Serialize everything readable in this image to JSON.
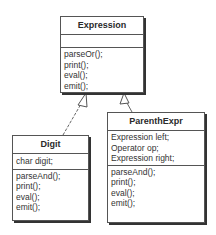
{
  "classes": {
    "expression": {
      "name": "Expression",
      "attributes": [],
      "methods": [
        "parseOr();",
        "print();",
        "eval();",
        "emit();"
      ]
    },
    "digit": {
      "name": "Digit",
      "attributes": [
        "char digit;"
      ],
      "methods": [
        "parseAnd();",
        "print();",
        "eval();",
        "emit();"
      ]
    },
    "parenthexpr": {
      "name": "ParenthExpr",
      "attributes": [
        "Expression left;",
        "Operator op;",
        "Expression right;"
      ],
      "methods": [
        "parseAnd();",
        "print();",
        "eval();",
        "emit();"
      ]
    }
  },
  "relations": [
    {
      "type": "generalization",
      "from": "Digit",
      "to": "Expression"
    },
    {
      "type": "generalization",
      "from": "ParenthExpr",
      "to": "Expression"
    }
  ],
  "colors": {
    "line": "#555555",
    "text": "#2a2a2a",
    "background": "#ffffff"
  }
}
